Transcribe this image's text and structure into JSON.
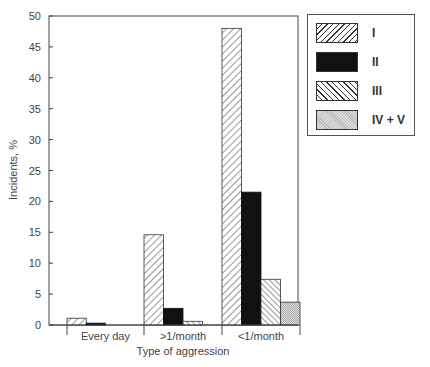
{
  "chart_data": {
    "type": "bar",
    "title": "",
    "xlabel": "Type of aggression",
    "ylabel": "Incidents, %",
    "ylim": [
      0,
      50
    ],
    "yticks": [
      0,
      5,
      10,
      15,
      20,
      25,
      30,
      35,
      40,
      45,
      50
    ],
    "grid": false,
    "legend_position": "right",
    "categories": [
      "Every day",
      ">1/month",
      "<1/month"
    ],
    "series": [
      {
        "name": "I",
        "pattern": "diagonal-hatch-forward",
        "values": [
          1.1,
          14.6,
          48.0
        ]
      },
      {
        "name": "II",
        "pattern": "solid-black",
        "values": [
          0.3,
          2.7,
          21.5
        ]
      },
      {
        "name": "III",
        "pattern": "diagonal-hatch-backward",
        "values": [
          0.0,
          0.6,
          7.4
        ]
      },
      {
        "name": "IV + V",
        "pattern": "stipple-gray",
        "values": [
          0.0,
          0.0,
          3.7
        ]
      }
    ]
  },
  "legend": {
    "items": [
      {
        "label": "I"
      },
      {
        "label": "II"
      },
      {
        "label": "III"
      },
      {
        "label": "IV + V"
      }
    ]
  }
}
